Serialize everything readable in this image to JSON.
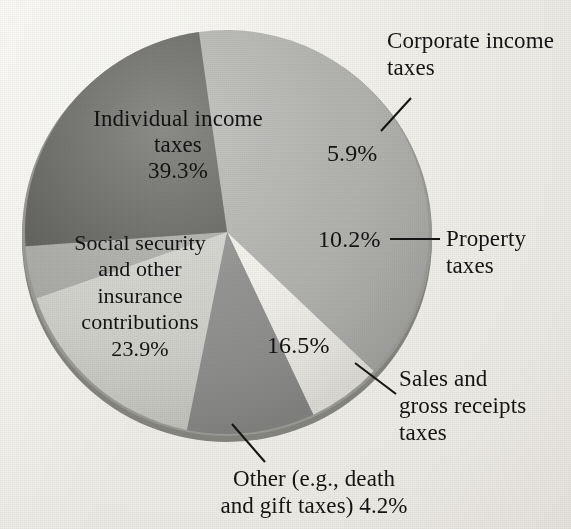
{
  "figure": {
    "background_color": "#efeee9",
    "text_color": "#141414"
  },
  "chart_data": {
    "type": "pie",
    "title": "",
    "subtitle": "",
    "xlabel": "",
    "ylabel": "",
    "legend_position": "none",
    "grid": false,
    "style": "3d-shaded pie, scanned textbook figure",
    "units": "percent of total tax revenue",
    "total": 100.0,
    "start_angle_deg": -8,
    "direction": "clockwise",
    "categories": [
      "Individual income taxes",
      "Corporate income taxes",
      "Property taxes",
      "Sales and gross receipts taxes",
      "Other (e.g., death and gift taxes)",
      "Social security and other insurance contributions"
    ],
    "values": [
      39.3,
      5.9,
      10.2,
      16.5,
      4.2,
      23.9
    ],
    "value_labels": [
      "39.3%",
      "5.9%",
      "10.2%",
      "16.5%",
      "4.2%",
      "23.9%"
    ],
    "colors": [
      "#b0b0ad",
      "#f1f0ea",
      "#8e8e8c",
      "#d0d0cb",
      "#a9a9a6",
      "#5b5b59"
    ],
    "slices": [
      {
        "name": "individual-income-taxes",
        "label": "Individual income\ntaxes",
        "percent_label": "39.3%",
        "value": 39.3,
        "color": "#b0b0ad",
        "label_placement": "inside"
      },
      {
        "name": "corporate-income-taxes",
        "label": "Corporate income\ntaxes",
        "percent_label": "5.9%",
        "value": 5.9,
        "color": "#f1f0ea",
        "label_placement": "callout"
      },
      {
        "name": "property-taxes",
        "label": "Property\ntaxes",
        "percent_label": "10.2%",
        "value": 10.2,
        "color": "#8e8e8c",
        "label_placement": "callout"
      },
      {
        "name": "sales-and-gross-receipts-taxes",
        "label": "Sales and\ngross receipts\ntaxes",
        "percent_label": "16.5%",
        "value": 16.5,
        "color": "#d0d0cb",
        "label_placement": "callout"
      },
      {
        "name": "other-death-and-gift-taxes",
        "label": "Other (e.g., death\nand gift taxes) 4.2%",
        "percent_label": "4.2%",
        "value": 4.2,
        "color": "#a9a9a6",
        "label_placement": "callout"
      },
      {
        "name": "social-security-and-other-insurance-contributions",
        "label": "Social security\nand other\ninsurance\ncontributions",
        "percent_label": "23.9%",
        "value": 23.9,
        "color": "#5b5b59",
        "label_placement": "inside"
      }
    ]
  },
  "labels": {
    "corporate": "Corporate income\ntaxes",
    "individual": "Individual income\ntaxes\n39.3%",
    "social": "Social security\nand other\ninsurance\ncontributions\n23.9%",
    "pct_corporate": "5.9%",
    "pct_property": "10.2%",
    "property": "Property\ntaxes",
    "pct_sales": "16.5%",
    "sales": "Sales and\ngross receipts\ntaxes",
    "other": "Other (e.g., death\nand gift taxes) 4.2%"
  }
}
